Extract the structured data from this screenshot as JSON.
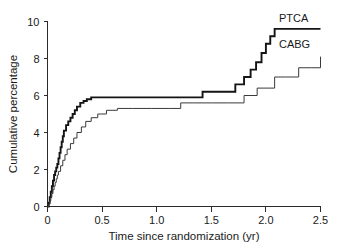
{
  "figure": {
    "clipped_header_left": "ssssss ss sssss ssssss ss ssss",
    "clipped_header_right": "ss"
  },
  "chart_data": {
    "type": "line",
    "title": "",
    "xlabel": "Time since randomization (yr)",
    "ylabel": "Cumulative percentage",
    "xlim": [
      0,
      2.5
    ],
    "ylim": [
      0,
      10
    ],
    "xticks": [
      "0",
      "0.5",
      "1.0",
      "1.5",
      "2.0",
      "2.5"
    ],
    "xtick_values": [
      0,
      0.5,
      1.0,
      1.5,
      2.0,
      2.5
    ],
    "yticks": [
      "0",
      "2",
      "4",
      "6",
      "8",
      "10"
    ],
    "ytick_values": [
      0,
      2,
      4,
      6,
      8,
      10
    ],
    "grid": false,
    "legend_position": "inline-right",
    "step_type": "post",
    "series": [
      {
        "name": "PTCA",
        "label": "PTCA",
        "color": "#141414",
        "linewidth": 1.9,
        "annotation_xy": [
          2.12,
          9.95
        ],
        "x": [
          0.0,
          0.01,
          0.02,
          0.03,
          0.04,
          0.05,
          0.06,
          0.07,
          0.08,
          0.09,
          0.1,
          0.11,
          0.12,
          0.13,
          0.14,
          0.15,
          0.17,
          0.19,
          0.21,
          0.23,
          0.25,
          0.27,
          0.3,
          0.33,
          0.36,
          0.4,
          0.45,
          0.52,
          0.62,
          0.75,
          0.95,
          1.18,
          1.42,
          1.6,
          1.72,
          1.8,
          1.86,
          1.91,
          1.96,
          2.0,
          2.04,
          2.08,
          2.5
        ],
        "y": [
          0.0,
          0.2,
          0.5,
          0.8,
          1.1,
          1.4,
          1.7,
          1.9,
          2.1,
          2.3,
          2.6,
          2.9,
          3.2,
          3.5,
          3.8,
          4.1,
          4.4,
          4.6,
          4.8,
          5.0,
          5.2,
          5.4,
          5.6,
          5.7,
          5.8,
          5.9,
          5.9,
          5.9,
          5.9,
          5.9,
          5.9,
          5.9,
          6.2,
          6.2,
          6.6,
          7.0,
          7.4,
          7.8,
          8.3,
          8.8,
          9.2,
          9.6,
          9.6
        ]
      },
      {
        "name": "CABG",
        "label": "CABG",
        "color": "#3a3a3a",
        "linewidth": 1.0,
        "annotation_xy": [
          2.12,
          8.55
        ],
        "x": [
          0.0,
          0.01,
          0.02,
          0.03,
          0.04,
          0.05,
          0.06,
          0.07,
          0.08,
          0.09,
          0.1,
          0.12,
          0.14,
          0.16,
          0.18,
          0.21,
          0.24,
          0.27,
          0.31,
          0.35,
          0.4,
          0.46,
          0.54,
          0.64,
          0.78,
          0.95,
          1.12,
          1.22,
          1.34,
          1.5,
          1.66,
          1.8,
          1.92,
          2.0,
          2.08,
          2.18,
          2.3,
          2.42,
          2.5
        ],
        "y": [
          0.0,
          0.1,
          0.3,
          0.5,
          0.7,
          0.9,
          1.1,
          1.3,
          1.5,
          1.7,
          1.9,
          2.2,
          2.5,
          2.8,
          3.1,
          3.4,
          3.7,
          4.0,
          4.3,
          4.6,
          4.8,
          5.0,
          5.2,
          5.3,
          5.3,
          5.3,
          5.3,
          5.6,
          5.6,
          5.6,
          5.6,
          6.0,
          6.4,
          6.4,
          7.0,
          7.0,
          7.5,
          7.5,
          8.1
        ]
      }
    ]
  }
}
